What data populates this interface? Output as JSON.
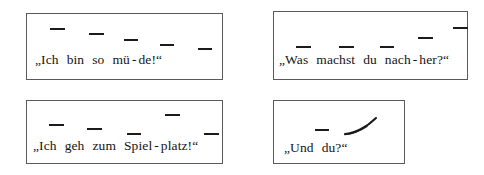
{
  "page": {
    "kind": "intonation-exercise",
    "language": "German",
    "background_color": "#ffffff",
    "mark_color": "#1b1b1b",
    "border_color": "#5a5a5a"
  },
  "boxes": [
    {
      "id": "box-fallend-mued",
      "sentence": "„Ich bin so mü - de!“",
      "open_quote": "„",
      "close_quote": "“",
      "contour": "falling",
      "tokens": [
        {
          "text": "Ich",
          "mark": "dash",
          "level": 5
        },
        {
          "text": "bin",
          "mark": "dash",
          "level": 4
        },
        {
          "text": "so",
          "mark": "dash",
          "level": 3
        },
        {
          "text": "mü",
          "mark": "dash",
          "level": 2
        },
        {
          "text": "-",
          "mark": "none",
          "level": 0
        },
        {
          "text": "de!",
          "mark": "dash",
          "level": 1
        }
      ]
    },
    {
      "id": "box-steigend-nachher",
      "sentence": "„Was machst du nach - her?“",
      "open_quote": "„",
      "close_quote": "“",
      "contour": "rising",
      "tokens": [
        {
          "text": "Was",
          "mark": "dash",
          "level": 2
        },
        {
          "text": "machst",
          "mark": "dash",
          "level": 2
        },
        {
          "text": "du",
          "mark": "dash",
          "level": 2
        },
        {
          "text": "nach",
          "mark": "dash",
          "level": 4
        },
        {
          "text": "-",
          "mark": "none",
          "level": 0
        },
        {
          "text": "her?",
          "mark": "dash",
          "level": 6
        }
      ]
    },
    {
      "id": "box-gipfel-spielplatz",
      "sentence": "„Ich geh zum Spiel-platz!“",
      "open_quote": "„",
      "close_quote": "“",
      "contour": "peak",
      "tokens": [
        {
          "text": "Ich",
          "mark": "dash",
          "level": 4
        },
        {
          "text": "geh",
          "mark": "dash",
          "level": 3
        },
        {
          "text": "zum",
          "mark": "dash",
          "level": 2
        },
        {
          "text": "Spiel",
          "mark": "dash",
          "level": 6
        },
        {
          "text": "-",
          "mark": "none",
          "level": 0
        },
        {
          "text": "platz!",
          "mark": "dash",
          "level": 2
        }
      ]
    },
    {
      "id": "box-steigend-unddu",
      "sentence": "„Und du?“",
      "open_quote": "„",
      "close_quote": "“",
      "contour": "rising-curve",
      "tokens": [
        {
          "text": "Und",
          "mark": "dash",
          "level": 3
        },
        {
          "text": "du?",
          "mark": "curve-rising",
          "level": 5
        }
      ]
    }
  ]
}
